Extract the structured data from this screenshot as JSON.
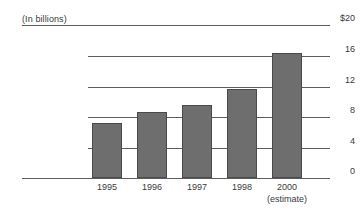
{
  "chart_data": {
    "type": "bar",
    "title": "",
    "subtitle": "(In billions)",
    "xlabel": "",
    "ylabel": "",
    "categories": [
      "1995",
      "1996",
      "1997",
      "1998",
      "2000"
    ],
    "category_annotations": [
      "",
      "",
      "",
      "",
      "(estimate)"
    ],
    "values": [
      7.2,
      8.6,
      9.6,
      11.7,
      16.4
    ],
    "ylim": [
      0,
      20
    ],
    "yticks": [
      0,
      4,
      8,
      12,
      16,
      20
    ],
    "ytick_labels": [
      "0",
      "4",
      "8",
      "12",
      "16",
      "$20"
    ],
    "grid": true,
    "grid_axis": "y",
    "legend": "none",
    "bar_color": "#6e6e6e",
    "bar_border_color": "#4a4a4a",
    "axis_color": "#5d5d5d",
    "background_color": "#ffffff",
    "series": [
      {
        "name": "Amount",
        "values": [
          7.2,
          8.6,
          9.6,
          11.7,
          16.4
        ]
      }
    ]
  },
  "caption": {
    "units_note": "(In billions)"
  },
  "axes": {
    "y": {
      "tick_20": "$20",
      "tick_16": "16",
      "tick_12": "12",
      "tick_8": "8",
      "tick_4": "4",
      "tick_0": "0"
    },
    "x": {
      "tick_0": "1995",
      "tick_1": "1996",
      "tick_2": "1997",
      "tick_3": "1998",
      "tick_4": "2000",
      "tick_4_sub": "(estimate)"
    }
  }
}
